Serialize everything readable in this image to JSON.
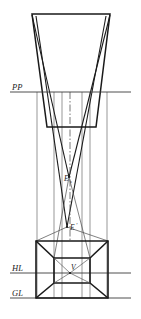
{
  "figure": {
    "background_color": "#ffffff",
    "line_color": "#1a1a1a",
    "thin_line_color": "#555555",
    "width": 141,
    "height": 319
  },
  "reference_lines": [
    {
      "id": "pp",
      "label": "PP",
      "name": "picture-plane-line",
      "y": 92,
      "x1": 10,
      "x2": 131,
      "label_x": 12,
      "label_y": 90
    },
    {
      "id": "hl",
      "label": "HL",
      "name": "horizon-line",
      "y": 273,
      "x1": 10,
      "x2": 131,
      "label_x": 12,
      "label_y": 271
    },
    {
      "id": "gl",
      "label": "GL",
      "name": "ground-line",
      "y": 298,
      "x1": 10,
      "x2": 131,
      "label_x": 12,
      "label_y": 296
    }
  ],
  "points": [
    {
      "id": "e_sub",
      "label": "E",
      "subscript": "s",
      "name": "station-point-elevated",
      "x": 69,
      "y": 177,
      "label_x": 65,
      "label_y": 181,
      "sub_x": 71,
      "sub_y": 183
    },
    {
      "id": "e_prime",
      "label": "E",
      "prime": "'",
      "name": "station-point-prime",
      "x": 67,
      "y": 227,
      "label_x": 69,
      "label_y": 230,
      "prime_x": 75,
      "prime_y": 227
    },
    {
      "id": "v",
      "label": "V",
      "name": "vanishing-point",
      "x": 70,
      "y": 273,
      "label_x": 71,
      "label_y": 269
    }
  ],
  "top_plan": {
    "name": "plan-view-trapezoid",
    "top_left_x": 32,
    "top_right_x": 110,
    "top_y": 14,
    "bottom_left_x": 47,
    "bottom_right_x": 96,
    "bottom_y": 127
  },
  "verticals": [
    {
      "name": "vertical-left-outer",
      "x": 37,
      "y1": 92,
      "y2": 298
    },
    {
      "name": "vertical-left-inner",
      "x": 54,
      "y1": 92,
      "y2": 298
    },
    {
      "name": "vertical-center-left",
      "x": 62,
      "y1": 92,
      "y2": 298
    },
    {
      "name": "vertical-center-right",
      "x": 82,
      "y1": 92,
      "y2": 298
    },
    {
      "name": "vertical-right-inner",
      "x": 90,
      "y1": 92,
      "y2": 298
    },
    {
      "name": "vertical-right-outer",
      "x": 107,
      "y1": 92,
      "y2": 298
    }
  ],
  "box": {
    "name": "perspective-cube",
    "front_left_x": 36,
    "front_right_x": 108,
    "front_top_y": 241,
    "front_bottom_y": 298,
    "back_left_x": 54,
    "back_right_x": 90,
    "back_top_y": 258,
    "back_bottom_y": 283
  },
  "center_axis": {
    "name": "center-axis-dash-dot",
    "x": 70,
    "y1": 92,
    "y2": 240,
    "dash_pattern": "7,2,1.5,2"
  },
  "sight_lines": {
    "name": "visual-ray-lines",
    "apex_upper_x": 69,
    "apex_upper_y": 177,
    "apex_lower_x": 67,
    "apex_lower_y": 227
  }
}
